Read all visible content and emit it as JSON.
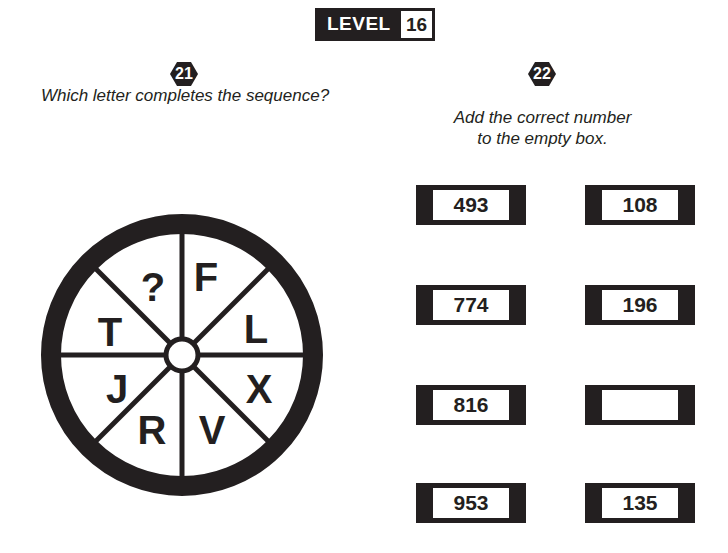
{
  "header": {
    "level_label": "LEVEL",
    "level_number": "16"
  },
  "puzzle21": {
    "number": "21",
    "question": "Which letter completes the sequence?",
    "wheel_segments": [
      "F",
      "L",
      "X",
      "V",
      "R",
      "J",
      "T",
      "?"
    ]
  },
  "puzzle22": {
    "number": "22",
    "question_line1": "Add the correct number",
    "question_line2": "to the empty box.",
    "boxes": {
      "left": [
        "493",
        "774",
        "816",
        "953"
      ],
      "right": [
        "108",
        "196",
        "",
        "135"
      ]
    }
  },
  "colors": {
    "ink": "#231f20",
    "paper": "#ffffff"
  }
}
